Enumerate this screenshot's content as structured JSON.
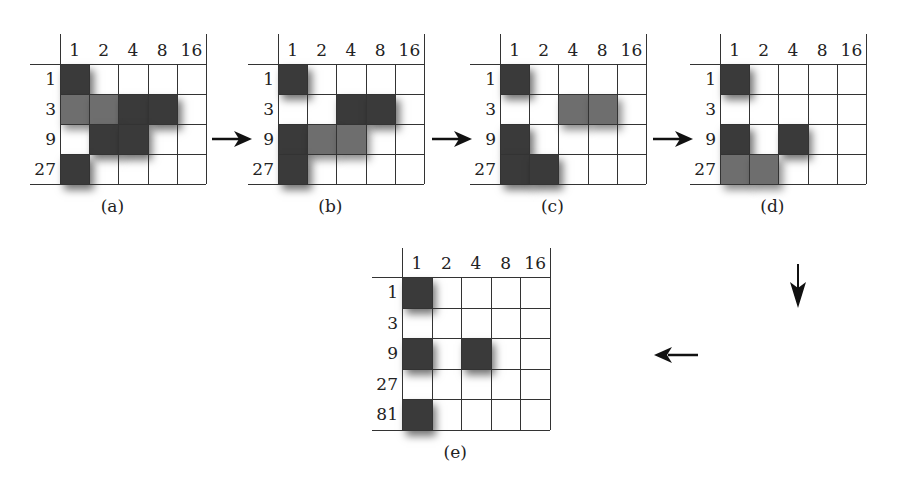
{
  "panels": [
    {
      "id": "a",
      "caption": "(a)",
      "columns": [
        "1",
        "2",
        "4",
        "8",
        "16"
      ],
      "rows": [
        "1",
        "3",
        "9",
        "27"
      ],
      "cells": [
        {
          "row": 0,
          "col": 0,
          "shade": "dark"
        },
        {
          "row": 1,
          "col": 0,
          "shade": "medium"
        },
        {
          "row": 1,
          "col": 1,
          "shade": "medium"
        },
        {
          "row": 1,
          "col": 2,
          "shade": "dark"
        },
        {
          "row": 1,
          "col": 3,
          "shade": "dark"
        },
        {
          "row": 2,
          "col": 1,
          "shade": "dark"
        },
        {
          "row": 2,
          "col": 2,
          "shade": "dark"
        },
        {
          "row": 3,
          "col": 0,
          "shade": "dark"
        }
      ]
    },
    {
      "id": "b",
      "caption": "(b)",
      "columns": [
        "1",
        "2",
        "4",
        "8",
        "16"
      ],
      "rows": [
        "1",
        "3",
        "9",
        "27"
      ],
      "cells": [
        {
          "row": 0,
          "col": 0,
          "shade": "dark"
        },
        {
          "row": 1,
          "col": 2,
          "shade": "dark"
        },
        {
          "row": 1,
          "col": 3,
          "shade": "dark"
        },
        {
          "row": 2,
          "col": 0,
          "shade": "dark"
        },
        {
          "row": 2,
          "col": 1,
          "shade": "medium"
        },
        {
          "row": 2,
          "col": 2,
          "shade": "medium"
        },
        {
          "row": 3,
          "col": 0,
          "shade": "dark"
        }
      ]
    },
    {
      "id": "c",
      "caption": "(c)",
      "columns": [
        "1",
        "2",
        "4",
        "8",
        "16"
      ],
      "rows": [
        "1",
        "3",
        "9",
        "27"
      ],
      "cells": [
        {
          "row": 0,
          "col": 0,
          "shade": "dark"
        },
        {
          "row": 1,
          "col": 2,
          "shade": "medium"
        },
        {
          "row": 1,
          "col": 3,
          "shade": "medium"
        },
        {
          "row": 2,
          "col": 0,
          "shade": "dark"
        },
        {
          "row": 3,
          "col": 0,
          "shade": "dark"
        },
        {
          "row": 3,
          "col": 1,
          "shade": "dark"
        }
      ]
    },
    {
      "id": "d",
      "caption": "(d)",
      "columns": [
        "1",
        "2",
        "4",
        "8",
        "16"
      ],
      "rows": [
        "1",
        "3",
        "9",
        "27"
      ],
      "cells": [
        {
          "row": 0,
          "col": 0,
          "shade": "dark"
        },
        {
          "row": 2,
          "col": 0,
          "shade": "dark"
        },
        {
          "row": 2,
          "col": 2,
          "shade": "dark"
        },
        {
          "row": 3,
          "col": 0,
          "shade": "medium"
        },
        {
          "row": 3,
          "col": 1,
          "shade": "medium"
        }
      ]
    },
    {
      "id": "e",
      "caption": "(e)",
      "columns": [
        "1",
        "2",
        "4",
        "8",
        "16"
      ],
      "rows": [
        "1",
        "3",
        "9",
        "27",
        "81"
      ],
      "cells": [
        {
          "row": 0,
          "col": 0,
          "shade": "dark"
        },
        {
          "row": 2,
          "col": 0,
          "shade": "dark"
        },
        {
          "row": 2,
          "col": 2,
          "shade": "dark"
        },
        {
          "row": 4,
          "col": 0,
          "shade": "dark"
        }
      ]
    }
  ],
  "arrows": [
    {
      "from": "a",
      "to": "b",
      "direction": "right"
    },
    {
      "from": "b",
      "to": "c",
      "direction": "right"
    },
    {
      "from": "c",
      "to": "d",
      "direction": "right"
    },
    {
      "from": "d",
      "to": "e",
      "direction": "down"
    },
    {
      "from": "d",
      "to": "e",
      "direction": "left"
    }
  ],
  "colors": {
    "dark": "#3a3a3a",
    "medium": "#6e6e6e",
    "line": "#333333"
  }
}
